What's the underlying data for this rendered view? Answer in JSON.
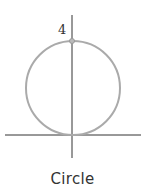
{
  "diagram": {
    "caption": "Circle",
    "point_label": "4",
    "colors": {
      "axis": "#333333",
      "circle": "#aaaaaa",
      "point": "#999999",
      "text": "#333333"
    },
    "geometry": {
      "origin": [
        72,
        135
      ],
      "circle_center": [
        73,
        88
      ],
      "circle_radius": 47,
      "top_point": [
        72,
        41
      ]
    }
  }
}
